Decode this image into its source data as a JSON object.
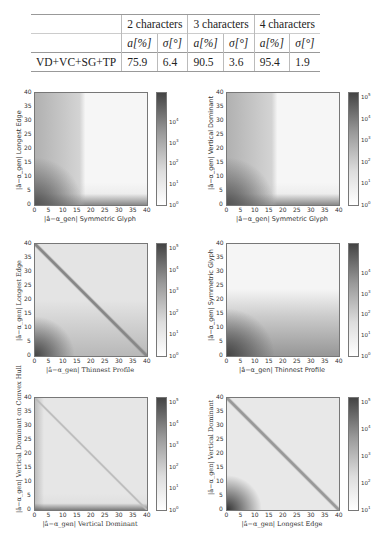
{
  "table": {
    "header_groups": [
      "2 characters",
      "3 characters",
      "4 characters"
    ],
    "sub_headers": [
      "a[%]",
      "σ[°]",
      "a[%]",
      "σ[°]",
      "a[%]",
      "σ[°]"
    ],
    "rows": [
      {
        "label": "VD+VC+SG+TP",
        "values": [
          "75.9",
          "6.4",
          "90.5",
          "3.6",
          "95.4",
          "1.9"
        ]
      }
    ]
  },
  "chart_data": [
    {
      "type": "heatmap",
      "xlabel": "|â−α_gen| Symmetric Glyph",
      "ylabel": "|â−α_gen| Longest Edge",
      "x_ticks": [
        "0",
        "5",
        "10",
        "15",
        "20",
        "25",
        "30",
        "35",
        "40"
      ],
      "y_ticks": [
        "0",
        "5",
        "10",
        "15",
        "20",
        "25",
        "30",
        "35",
        "40"
      ],
      "xlim": [
        0,
        40
      ],
      "ylim": [
        0,
        40
      ],
      "colorbar_ticks": [
        "10^0",
        "10^1",
        "10^2",
        "10^3",
        "10^4"
      ],
      "colorbar_scale": "log",
      "pattern": "dense along left edge (x<16) and bottom rows, sparse elsewhere"
    },
    {
      "type": "heatmap",
      "xlabel": "|â−α_gen| Symmetric Glyph",
      "ylabel": "|â−α_gen| Vertical Dominant",
      "x_ticks": [
        "0",
        "5",
        "10",
        "15",
        "20",
        "25",
        "30",
        "35",
        "40"
      ],
      "y_ticks": [
        "0",
        "5",
        "10",
        "15",
        "20",
        "25",
        "30",
        "35",
        "40"
      ],
      "xlim": [
        0,
        40
      ],
      "ylim": [
        0,
        40
      ],
      "colorbar_ticks": [
        "10^0",
        "10^1",
        "10^2",
        "10^3",
        "10^4",
        "10^5"
      ],
      "colorbar_scale": "log",
      "pattern": "dense along left edge (x<16) and bottom rows, sparse elsewhere"
    },
    {
      "type": "heatmap",
      "xlabel": "|â−α_gen| Thinnest Profile",
      "ylabel": "|â−α_gen| Longest Edge",
      "x_ticks": [
        "0",
        "5",
        "10",
        "15",
        "20",
        "25",
        "30",
        "35",
        "40"
      ],
      "y_ticks": [
        "0",
        "5",
        "10",
        "15",
        "20",
        "25",
        "30",
        "35",
        "40"
      ],
      "xlim": [
        0,
        40
      ],
      "ylim": [
        0,
        40
      ],
      "colorbar_ticks": [
        "10^0",
        "10^1",
        "10^2",
        "10^3",
        "10^4",
        "10^5"
      ],
      "colorbar_scale": "log",
      "pattern": "strong diagonal, dense bottom-left corner"
    },
    {
      "type": "heatmap",
      "xlabel": "|â−α_gen| Thinnest Profile",
      "ylabel": "|â−α_gen| Symmetric Glyph",
      "x_ticks": [
        "0",
        "5",
        "10",
        "15",
        "20",
        "25",
        "30",
        "35",
        "40"
      ],
      "y_ticks": [
        "0",
        "5",
        "10",
        "15",
        "20",
        "25",
        "30",
        "35",
        "40"
      ],
      "xlim": [
        0,
        40
      ],
      "ylim": [
        0,
        40
      ],
      "colorbar_ticks": [
        "10^0",
        "10^1",
        "10^2",
        "10^3",
        "10^4"
      ],
      "colorbar_scale": "log",
      "pattern": "dense bottom region (y<16), sparse top"
    },
    {
      "type": "heatmap",
      "xlabel": "|â−α_gen| Vertical Dominant",
      "ylabel": "|â−α_gen| Vertical Dominant on Convex Hull",
      "x_ticks": [
        "0",
        "5",
        "10",
        "15",
        "20",
        "25",
        "30",
        "35",
        "40"
      ],
      "y_ticks": [
        "0",
        "5",
        "10",
        "15",
        "20",
        "25",
        "30",
        "35",
        "40"
      ],
      "xlim": [
        0,
        40
      ],
      "ylim": [
        0,
        40
      ],
      "colorbar_ticks": [
        "10^0",
        "10^1",
        "10^2",
        "10^3",
        "10^4",
        "10^5"
      ],
      "colorbar_scale": "log",
      "pattern": "faint diagonal, dense bottom row and left column"
    },
    {
      "type": "heatmap",
      "xlabel": "|â−α_gen| Longest Edge",
      "ylabel": "|â−α_gen| Vertical Dominant",
      "x_ticks": [
        "0",
        "5",
        "10",
        "15",
        "20",
        "25",
        "30",
        "35",
        "40"
      ],
      "y_ticks": [
        "0",
        "5",
        "10",
        "15",
        "20",
        "25",
        "30",
        "35",
        "40"
      ],
      "xlim": [
        0,
        40
      ],
      "ylim": [
        0,
        40
      ],
      "colorbar_ticks": [
        "10^1",
        "10^2",
        "10^3",
        "10^4",
        "10^5"
      ],
      "colorbar_scale": "log",
      "pattern": "strong diagonal, dense bottom-left corner"
    }
  ]
}
